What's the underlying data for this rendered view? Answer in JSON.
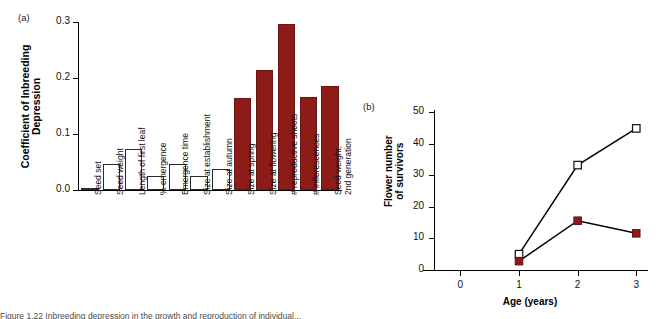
{
  "figure": {
    "caption_fragment": "Figure 1.22  Inbreeding depression in the growth and reproduction of individual..."
  },
  "colors": {
    "filled_bar": "#8d1b17",
    "open_bar": "#ffffff",
    "bar_outline": "#2b2b2b",
    "axis": "#000000"
  },
  "chart_data": [
    {
      "type": "bar",
      "panel": "(a)",
      "title": "",
      "xlabel": "",
      "ylabel": "Coefficient of Inbreeding Depression",
      "ylim": [
        0.0,
        0.3
      ],
      "yticks": [
        0.0,
        0.1,
        0.2,
        0.3
      ],
      "ytick_labels": [
        "0.0",
        "0.1",
        "0.2",
        "0.3"
      ],
      "grid": false,
      "legend": "none",
      "categories": [
        "Seed set",
        "Seed weight",
        "Length of first leaf",
        "% emergence",
        "Emergence time",
        "Size at establishment",
        "Size at autumn",
        "Size at spring",
        "Size at flowering",
        "# reproductive shoots",
        "# inflorescences",
        "Seed weight,\n2nd generation"
      ],
      "values": [
        0.002,
        0.046,
        0.073,
        0.025,
        0.046,
        0.025,
        0.038,
        0.164,
        0.214,
        0.297,
        0.166,
        0.186
      ],
      "fills": [
        "open",
        "open",
        "open",
        "open",
        "open",
        "open",
        "open",
        "filled",
        "filled",
        "filled",
        "filled",
        "filled"
      ]
    },
    {
      "type": "line",
      "panel": "(b)",
      "title": "",
      "xlabel": "Age (years)",
      "ylabel": "Flower number\nof survivors",
      "xlim": [
        -0.45,
        3.2
      ],
      "ylim": [
        0,
        50
      ],
      "xticks": [
        0,
        1,
        2,
        3
      ],
      "xtick_labels": [
        "0",
        "1",
        "2",
        "3"
      ],
      "yticks": [
        0,
        10,
        20,
        30,
        40,
        50
      ],
      "ytick_labels": [
        "0",
        "10",
        "20",
        "30",
        "40",
        "50"
      ],
      "grid": false,
      "legend": "none",
      "x": [
        1,
        2,
        3
      ],
      "series": [
        {
          "name": "outcrossed",
          "marker": "open-square",
          "values": [
            5.0,
            33.2,
            44.8
          ]
        },
        {
          "name": "inbred",
          "marker": "filled-square",
          "values": [
            2.8,
            15.6,
            11.6
          ]
        }
      ]
    }
  ],
  "panel_a": {
    "letter": "(a)",
    "ylabel": "Coefficient of Inbreeding Depression"
  },
  "panel_b": {
    "letter": "(b)",
    "ylabel_line1": "Flower number",
    "ylabel_line2": "of survivors",
    "xlabel": "Age (years)"
  }
}
